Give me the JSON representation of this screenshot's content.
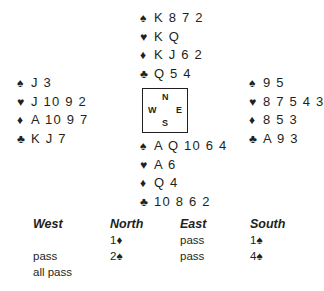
{
  "suit_symbols": {
    "spades": "♠",
    "hearts": "♥",
    "diamonds": "♦",
    "clubs": "♣"
  },
  "hands": {
    "north": {
      "spades": "K 8 7 2",
      "hearts": "K Q",
      "diamonds": "K J 6 2",
      "clubs": "Q 5 4"
    },
    "west": {
      "spades": "J 3",
      "hearts": "J 10 9 2",
      "diamonds": "A 10 9 7",
      "clubs": "K J 7"
    },
    "east": {
      "spades": "9 5",
      "hearts": "8 7 5 4 3",
      "diamonds": "8 5 3",
      "clubs": "A 9 3"
    },
    "south": {
      "spades": "A Q 10 6 4",
      "hearts": "A 6",
      "diamonds": "Q 4",
      "clubs": "10 8 6 2"
    }
  },
  "compass": {
    "n": "N",
    "w": "W",
    "e": "E",
    "s": "S"
  },
  "auction": {
    "headers": [
      "West",
      "North",
      "East",
      "South"
    ],
    "rows": [
      [
        "",
        "1♦",
        "pass",
        "1♠"
      ],
      [
        "pass",
        "2♠",
        "pass",
        "4♠"
      ],
      [
        "all pass",
        "",
        "",
        ""
      ]
    ]
  }
}
